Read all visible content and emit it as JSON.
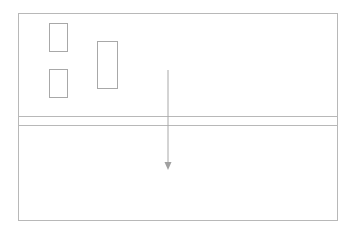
{
  "diagram": {
    "stroke_color": "#b8b8b8",
    "arrow_color": "#a0a0a0",
    "panels": [
      {
        "id": "upper-panel",
        "label": ""
      },
      {
        "id": "lower-panel",
        "label": ""
      }
    ],
    "blocks": [
      {
        "id": "block-top-left",
        "label": ""
      },
      {
        "id": "block-bottom-left",
        "label": ""
      },
      {
        "id": "block-tall-center",
        "label": ""
      }
    ],
    "arrow": {
      "direction": "down",
      "from": "upper-panel",
      "to": "lower-panel"
    }
  }
}
